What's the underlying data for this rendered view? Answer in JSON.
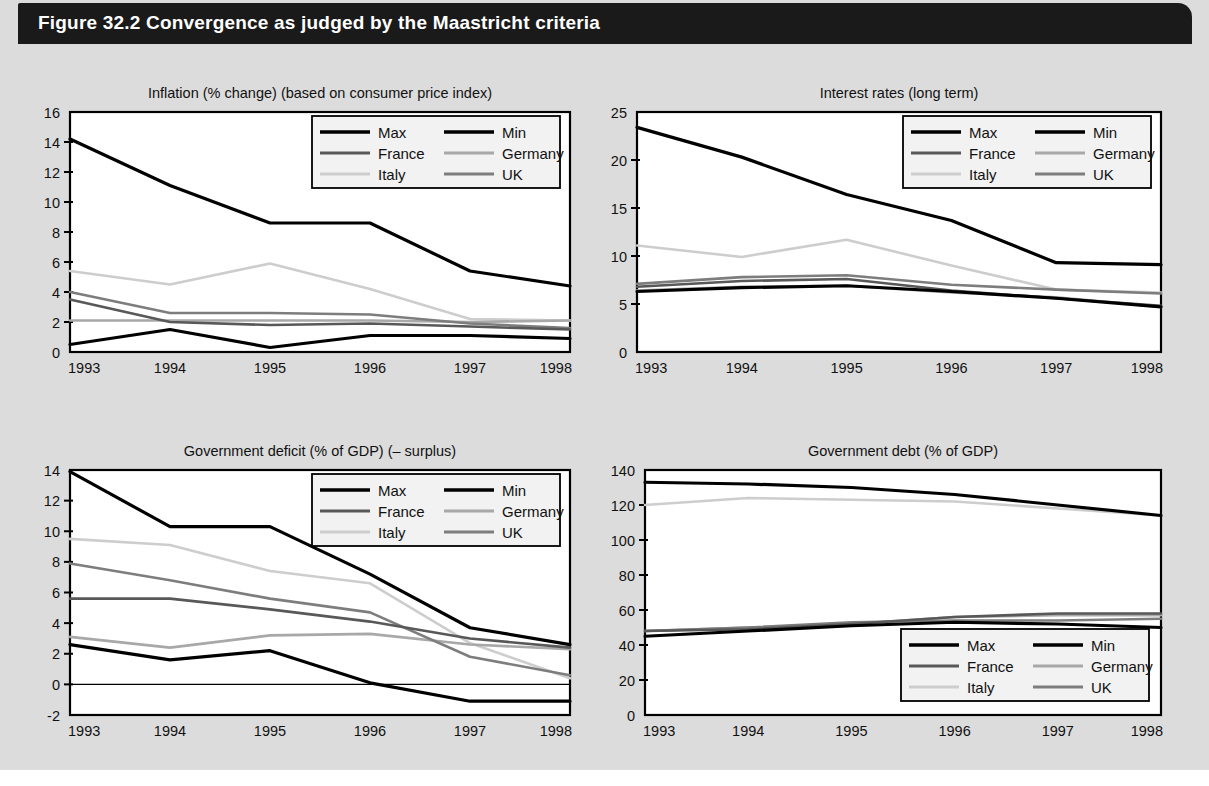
{
  "figure": {
    "title": "Figure 32.2  Convergence as judged by the Maastricht criteria",
    "background_color": "#dcdcdc",
    "title_bar_color": "#1a1a1a",
    "title_text_color": "#ffffff"
  },
  "series_colors": {
    "Max": "#000000",
    "Min": "#000000",
    "France": "#585858",
    "Germany": "#a8a8a8",
    "Italy": "#cdcdcd",
    "UK": "#7d7d7d"
  },
  "legend_order": [
    "Max",
    "Min",
    "France",
    "Germany",
    "Italy",
    "UK"
  ],
  "chart_data": [
    {
      "id": "inflation",
      "type": "line",
      "title": "Inflation (% change) (based on consumer price index)",
      "xlabel": "",
      "ylabel": "",
      "x": [
        "1993",
        "1994",
        "1995",
        "1996",
        "1997",
        "1998"
      ],
      "ylim": [
        0,
        16
      ],
      "yticks": [
        0,
        2,
        4,
        6,
        8,
        10,
        12,
        14,
        16
      ],
      "grid": false,
      "legend_position": "top-right",
      "series": [
        {
          "name": "Max",
          "values": [
            14.2,
            11.1,
            8.6,
            8.6,
            5.4,
            4.4
          ]
        },
        {
          "name": "Min",
          "values": [
            0.5,
            1.5,
            0.3,
            1.1,
            1.1,
            0.9
          ]
        },
        {
          "name": "France",
          "values": [
            3.5,
            2.0,
            1.8,
            1.9,
            1.7,
            1.5
          ]
        },
        {
          "name": "Germany",
          "values": [
            2.1,
            2.1,
            2.1,
            2.1,
            2.0,
            2.1
          ]
        },
        {
          "name": "Italy",
          "values": [
            5.4,
            4.5,
            5.9,
            4.2,
            2.2,
            2.1
          ]
        },
        {
          "name": "UK",
          "values": [
            4.0,
            2.6,
            2.6,
            2.5,
            1.9,
            1.6
          ]
        }
      ]
    },
    {
      "id": "interest-rates",
      "type": "line",
      "title": "Interest rates (long term)",
      "xlabel": "",
      "ylabel": "",
      "x": [
        "1993",
        "1994",
        "1995",
        "1996",
        "1997",
        "1998"
      ],
      "ylim": [
        0,
        25
      ],
      "yticks": [
        0,
        5,
        10,
        15,
        20,
        25
      ],
      "grid": false,
      "legend_position": "top-right",
      "series": [
        {
          "name": "Max",
          "values": [
            23.4,
            20.3,
            16.4,
            13.7,
            9.3,
            9.1
          ]
        },
        {
          "name": "Min",
          "values": [
            6.3,
            6.7,
            6.9,
            6.3,
            5.6,
            4.7
          ]
        },
        {
          "name": "France",
          "values": [
            6.8,
            7.4,
            7.6,
            6.4,
            5.6,
            4.8
          ]
        },
        {
          "name": "Germany",
          "values": [
            6.4,
            6.8,
            6.9,
            6.2,
            5.7,
            4.7
          ]
        },
        {
          "name": "Italy",
          "values": [
            11.1,
            9.9,
            11.7,
            9.0,
            6.5,
            6.2
          ]
        },
        {
          "name": "UK",
          "values": [
            7.1,
            7.8,
            8.0,
            7.0,
            6.5,
            6.1
          ]
        }
      ]
    },
    {
      "id": "government-deficit",
      "type": "line",
      "title": "Government deficit (% of GDP) (– surplus)",
      "xlabel": "",
      "ylabel": "",
      "x": [
        "1993",
        "1994",
        "1995",
        "1996",
        "1997",
        "1998"
      ],
      "ylim": [
        -2,
        14
      ],
      "yticks": [
        -2,
        0,
        2,
        4,
        6,
        8,
        10,
        12,
        14
      ],
      "grid": false,
      "zero_line": true,
      "legend_position": "top-right",
      "series": [
        {
          "name": "Max",
          "values": [
            13.9,
            10.3,
            10.3,
            7.2,
            3.7,
            2.6
          ]
        },
        {
          "name": "Min",
          "values": [
            2.6,
            1.6,
            2.2,
            0.1,
            -1.1,
            -1.1
          ]
        },
        {
          "name": "France",
          "values": [
            5.6,
            5.6,
            4.9,
            4.1,
            3.0,
            2.4
          ]
        },
        {
          "name": "Germany",
          "values": [
            3.1,
            2.4,
            3.2,
            3.3,
            2.6,
            2.3
          ]
        },
        {
          "name": "Italy",
          "values": [
            9.5,
            9.1,
            7.4,
            6.6,
            2.7,
            0.4
          ]
        },
        {
          "name": "UK",
          "values": [
            7.9,
            6.8,
            5.6,
            4.7,
            1.8,
            0.6
          ]
        }
      ]
    },
    {
      "id": "government-debt",
      "type": "line",
      "title": "Government debt (% of GDP)",
      "xlabel": "",
      "ylabel": "",
      "x": [
        "1993",
        "1994",
        "1995",
        "1996",
        "1997",
        "1998"
      ],
      "ylim": [
        0,
        140
      ],
      "yticks": [
        0,
        20,
        40,
        60,
        80,
        100,
        120,
        140
      ],
      "grid": false,
      "legend_position": "bottom-right",
      "series": [
        {
          "name": "Max",
          "values": [
            133,
            132,
            130,
            126,
            120,
            114
          ]
        },
        {
          "name": "Min",
          "values": [
            45,
            48,
            51,
            53,
            52,
            50
          ]
        },
        {
          "name": "France",
          "values": [
            48,
            49,
            52,
            56,
            58,
            58
          ]
        },
        {
          "name": "Germany",
          "values": [
            48,
            50,
            52,
            56,
            57,
            57
          ]
        },
        {
          "name": "Italy",
          "values": [
            120,
            124,
            123,
            122,
            118,
            114
          ]
        },
        {
          "name": "UK",
          "values": [
            48,
            50,
            53,
            54,
            54,
            55
          ]
        }
      ]
    }
  ]
}
